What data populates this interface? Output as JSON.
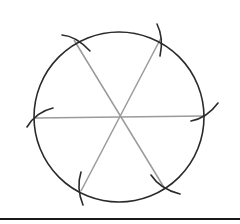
{
  "diagram": {
    "canvas": {
      "width": 240,
      "height": 224,
      "background": "#ffffff"
    },
    "circle": {
      "cx": 119,
      "cy": 117,
      "r": 85,
      "stroke": "#2a2a2a"
    },
    "diameters": {
      "stroke": "#9a9a9a",
      "lines": [
        {
          "x1": 35,
          "y1": 118,
          "x2": 204,
          "y2": 116
        },
        {
          "x1": 74,
          "y1": 40,
          "x2": 165,
          "y2": 189
        },
        {
          "x1": 161,
          "y1": 38,
          "x2": 81,
          "y2": 191
        }
      ]
    },
    "division_points": [
      {
        "name": "left",
        "x": 35,
        "y": 118
      },
      {
        "name": "top-left",
        "x": 74,
        "y": 40
      },
      {
        "name": "top-right",
        "x": 161,
        "y": 38
      },
      {
        "name": "right",
        "x": 204,
        "y": 116
      },
      {
        "name": "bottom-right",
        "x": 165,
        "y": 189
      },
      {
        "name": "bottom-left",
        "x": 81,
        "y": 191
      }
    ],
    "arc_marks": {
      "stroke": "#2a2a2a",
      "paths": [
        "M27 127 Q36 112 53 108",
        "M62 35 Q76 36 90 51",
        "M157 24 Q164 38 160 56",
        "M191 121 Q207 118 218 103",
        "M151 175 Q160 189 180 194",
        "M81 172 Q76 188 83 205"
      ]
    },
    "baseline": {
      "x1": 0,
      "y1": 219,
      "x2": 240,
      "y2": 219,
      "stroke": "#1a1a1a"
    }
  }
}
